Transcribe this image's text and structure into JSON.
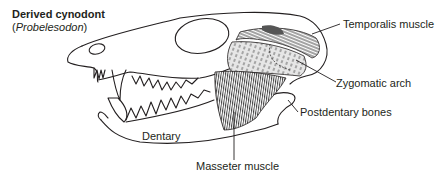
{
  "figure": {
    "title": "Derived cynodont",
    "subtitle_open": "(",
    "subtitle_genus": "Probelesodon",
    "subtitle_close": ")"
  },
  "labels": {
    "temporalis": "Temporalis muscle",
    "zygomatic": "Zygomatic arch",
    "postdentary": "Postdentary bones",
    "dentary": "Dentary",
    "masseter": "Masseter muscle"
  },
  "colors": {
    "line": "#231f20",
    "shade_light": "#d9d9d9",
    "shade_dark": "#555555",
    "background": "#ffffff"
  }
}
